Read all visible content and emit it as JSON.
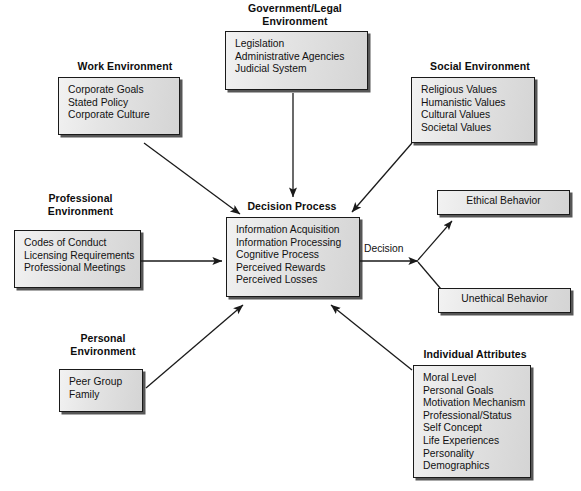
{
  "diagram": {
    "type": "flowchart",
    "background": "#ffffff",
    "box_fill": "#e6e6e6",
    "box_border": "#1a1a1a",
    "arrow_color": "#1a1a1a",
    "nodes": [
      {
        "id": "government-legal-environment",
        "title": "Government/Legal\nEnvironment",
        "items": [
          "Legislation",
          "Administrative Agencies",
          "Judicial System"
        ]
      },
      {
        "id": "work-environment",
        "title": "Work Environment",
        "items": [
          "Corporate Goals",
          "Stated Policy",
          "Corporate Culture"
        ]
      },
      {
        "id": "social-environment",
        "title": "Social Environment",
        "items": [
          "Religious Values",
          "Humanistic Values",
          "Cultural Values",
          "Societal Values"
        ]
      },
      {
        "id": "professional-environment",
        "title": "Professional\nEnvironment",
        "items": [
          "Codes of Conduct",
          "Licensing Requirements",
          "Professional Meetings"
        ]
      },
      {
        "id": "personal-environment",
        "title": "Personal\nEnvironment",
        "items": [
          "Peer Group",
          "Family"
        ]
      },
      {
        "id": "decision-process",
        "title": "Decision Process",
        "items": [
          "Information Acquisition",
          "Information Processing",
          "Cognitive Process",
          "Perceived Rewards",
          "Perceived Losses"
        ]
      },
      {
        "id": "individual-attributes",
        "title": "Individual Attributes",
        "items": [
          "Moral Level",
          "Personal Goals",
          "Motivation Mechanism",
          "Professional/Status",
          "Self Concept",
          "Life Experiences",
          "Personality",
          "Demographics"
        ]
      },
      {
        "id": "ethical-behavior",
        "title": "",
        "items": [
          "Ethical Behavior"
        ]
      },
      {
        "id": "unethical-behavior",
        "title": "",
        "items": [
          "Unethical Behavior"
        ]
      }
    ],
    "edges": [
      {
        "id": "government-to-decision",
        "label": "",
        "from": "government-legal-environment",
        "to": "decision-process"
      },
      {
        "id": "work-to-decision",
        "label": "",
        "from": "work-environment",
        "to": "decision-process"
      },
      {
        "id": "social-to-decision",
        "label": "",
        "from": "social-environment",
        "to": "decision-process"
      },
      {
        "id": "professional-to-decision",
        "label": "",
        "from": "professional-environment",
        "to": "decision-process"
      },
      {
        "id": "personal-to-decision",
        "label": "",
        "from": "personal-environment",
        "to": "decision-process"
      },
      {
        "id": "individual-attributes-to-decision",
        "label": "",
        "from": "individual-attributes",
        "to": "decision-process"
      },
      {
        "id": "decision-to-split",
        "label": "Decision",
        "from": "decision-process",
        "to": "split-point"
      },
      {
        "id": "split-to-ethical",
        "label": "",
        "from": "split-point",
        "to": "ethical-behavior"
      },
      {
        "id": "split-to-unethical",
        "label": "",
        "from": "split-point",
        "to": "unethical-behavior"
      }
    ]
  }
}
